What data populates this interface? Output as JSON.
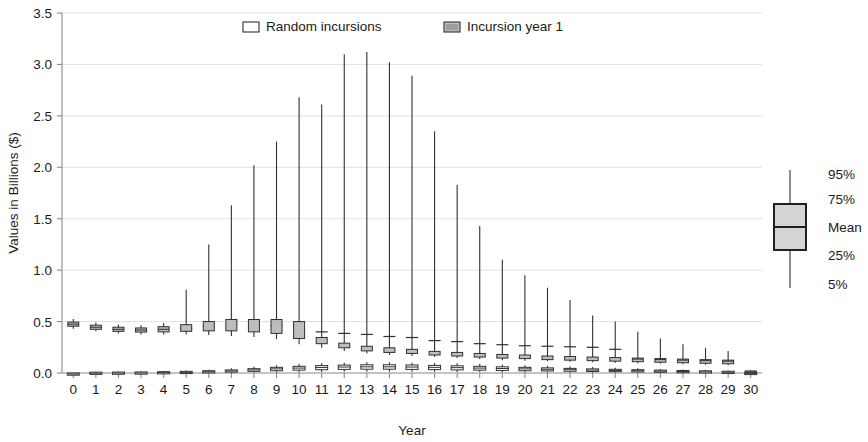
{
  "chart_data": {
    "type": "box",
    "title": "",
    "xlabel": "Year",
    "ylabel": "Values in Billions ($)",
    "xlim": [
      -0.5,
      30.5
    ],
    "ylim": [
      0.0,
      3.5
    ],
    "ytick_labels": [
      "0.0",
      "0.5",
      "1.0",
      "1.5",
      "2.0",
      "2.5",
      "3.0",
      "3.5"
    ],
    "ytick_values": [
      0.0,
      0.5,
      1.0,
      1.5,
      2.0,
      2.5,
      3.0,
      3.5
    ],
    "xtick_labels": [
      "0",
      "1",
      "2",
      "3",
      "4",
      "5",
      "6",
      "7",
      "8",
      "9",
      "10",
      "11",
      "12",
      "13",
      "14",
      "15",
      "16",
      "17",
      "18",
      "19",
      "20",
      "21",
      "22",
      "23",
      "24",
      "25",
      "26",
      "27",
      "28",
      "29",
      "30"
    ],
    "grid": true,
    "grid_axis": "y",
    "legend": {
      "position": "top-center",
      "entries": [
        {
          "label": "Random incursions",
          "fill": "#ffffff",
          "stroke": "#303030"
        },
        {
          "label": "Incursion year 1",
          "fill": "#bdbdbd",
          "stroke": "#303030"
        }
      ]
    },
    "key": {
      "position": "right",
      "labels": [
        "95%",
        "75%",
        "Mean",
        "25%",
        "5%"
      ],
      "fill": "#d4d4d4",
      "stroke": "#202020"
    },
    "series": [
      {
        "name": "Incursion year 1",
        "fill": "#bdbdbd",
        "stroke": "#303030",
        "boxes": [
          {
            "x": 0,
            "p5": 0.43,
            "p25": 0.455,
            "mean": 0.475,
            "p75": 0.495,
            "p95": 0.525
          },
          {
            "x": 1,
            "p5": 0.405,
            "p25": 0.425,
            "mean": 0.445,
            "p75": 0.465,
            "p95": 0.49
          },
          {
            "x": 2,
            "p5": 0.385,
            "p25": 0.405,
            "mean": 0.425,
            "p75": 0.445,
            "p95": 0.47
          },
          {
            "x": 3,
            "p5": 0.375,
            "p25": 0.398,
            "mean": 0.418,
            "p75": 0.438,
            "p95": 0.465
          },
          {
            "x": 4,
            "p5": 0.375,
            "p25": 0.4,
            "mean": 0.425,
            "p75": 0.45,
            "p95": 0.485
          },
          {
            "x": 5,
            "p5": 0.375,
            "p25": 0.405,
            "mean": 0.435,
            "p75": 0.47,
            "p95": 0.81
          },
          {
            "x": 6,
            "p5": 0.37,
            "p25": 0.41,
            "mean": 0.455,
            "p75": 0.5,
            "p95": 1.25
          },
          {
            "x": 7,
            "p5": 0.36,
            "p25": 0.41,
            "mean": 0.47,
            "p75": 0.52,
            "p95": 1.63
          },
          {
            "x": 8,
            "p5": 0.35,
            "p25": 0.4,
            "mean": 0.465,
            "p75": 0.52,
            "p95": 2.02
          },
          {
            "x": 9,
            "p5": 0.33,
            "p25": 0.385,
            "mean": 0.46,
            "p75": 0.52,
            "p95": 2.25
          },
          {
            "x": 10,
            "p5": 0.28,
            "p25": 0.335,
            "mean": 0.43,
            "p75": 0.5,
            "p95": 2.68
          },
          {
            "x": 11,
            "p5": 0.245,
            "p25": 0.285,
            "mean": 0.4,
            "p75": 0.345,
            "p95": 2.61
          },
          {
            "x": 12,
            "p5": 0.215,
            "p25": 0.245,
            "mean": 0.385,
            "p75": 0.29,
            "p95": 3.1
          },
          {
            "x": 13,
            "p5": 0.19,
            "p25": 0.215,
            "mean": 0.375,
            "p75": 0.26,
            "p95": 3.12
          },
          {
            "x": 14,
            "p5": 0.175,
            "p25": 0.2,
            "mean": 0.355,
            "p75": 0.245,
            "p95": 3.02
          },
          {
            "x": 15,
            "p5": 0.165,
            "p25": 0.19,
            "mean": 0.345,
            "p75": 0.23,
            "p95": 2.89
          },
          {
            "x": 16,
            "p5": 0.155,
            "p25": 0.175,
            "mean": 0.315,
            "p75": 0.21,
            "p95": 2.35
          },
          {
            "x": 17,
            "p5": 0.145,
            "p25": 0.165,
            "mean": 0.305,
            "p75": 0.2,
            "p95": 1.83
          },
          {
            "x": 18,
            "p5": 0.135,
            "p25": 0.155,
            "mean": 0.285,
            "p75": 0.19,
            "p95": 1.43
          },
          {
            "x": 19,
            "p5": 0.125,
            "p25": 0.145,
            "mean": 0.275,
            "p75": 0.18,
            "p95": 1.1
          },
          {
            "x": 20,
            "p5": 0.12,
            "p25": 0.14,
            "mean": 0.265,
            "p75": 0.175,
            "p95": 0.95
          },
          {
            "x": 21,
            "p5": 0.115,
            "p25": 0.13,
            "mean": 0.26,
            "p75": 0.165,
            "p95": 0.83
          },
          {
            "x": 22,
            "p5": 0.11,
            "p25": 0.125,
            "mean": 0.255,
            "p75": 0.16,
            "p95": 0.71
          },
          {
            "x": 23,
            "p5": 0.105,
            "p25": 0.12,
            "mean": 0.25,
            "p75": 0.155,
            "p95": 0.56
          },
          {
            "x": 24,
            "p5": 0.1,
            "p25": 0.115,
            "mean": 0.23,
            "p75": 0.15,
            "p95": 0.5
          },
          {
            "x": 25,
            "p5": 0.095,
            "p25": 0.11,
            "mean": 0.215,
            "p75": 0.145,
            "p95": 0.4
          },
          {
            "x": 26,
            "p5": 0.09,
            "p25": 0.105,
            "mean": 0.205,
            "p75": 0.14,
            "p95": 0.335
          },
          {
            "x": 27,
            "p5": 0.085,
            "p25": 0.1,
            "mean": 0.195,
            "p75": 0.135,
            "p95": 0.28
          },
          {
            "x": 28,
            "p5": 0.08,
            "p25": 0.095,
            "mean": 0.19,
            "p75": 0.13,
            "p95": 0.245
          },
          {
            "x": 29,
            "p5": 0.075,
            "p25": 0.09,
            "mean": 0.185,
            "p75": 0.125,
            "p95": 0.215
          },
          {
            "x": 30,
            "p5": 0.005,
            "p25": 0.01,
            "mean": 0.015,
            "p75": 0.02,
            "p95": 0.025
          }
        ]
      },
      {
        "name": "Random incursions",
        "fill": "#ffffff",
        "stroke": "#303030",
        "boxes": [
          {
            "x": 0,
            "p5": 0.0,
            "p25": 0.0,
            "mean": 0.0,
            "p75": 0.0,
            "p95": 0.0
          },
          {
            "x": 1,
            "p5": 0.0,
            "p25": 0.0,
            "mean": 0.005,
            "p75": 0.008,
            "p95": 0.012
          },
          {
            "x": 2,
            "p5": 0.0,
            "p25": 0.0,
            "mean": 0.005,
            "p75": 0.009,
            "p95": 0.013
          },
          {
            "x": 3,
            "p5": 0.0,
            "p25": 0.002,
            "mean": 0.006,
            "p75": 0.01,
            "p95": 0.015
          },
          {
            "x": 4,
            "p5": 0.0,
            "p25": 0.003,
            "mean": 0.008,
            "p75": 0.013,
            "p95": 0.018
          },
          {
            "x": 5,
            "p5": 0.0,
            "p25": 0.004,
            "mean": 0.01,
            "p75": 0.016,
            "p95": 0.024
          },
          {
            "x": 6,
            "p5": 0.0,
            "p25": 0.006,
            "mean": 0.014,
            "p75": 0.022,
            "p95": 0.032
          },
          {
            "x": 7,
            "p5": 0.002,
            "p25": 0.01,
            "mean": 0.02,
            "p75": 0.03,
            "p95": 0.045
          },
          {
            "x": 8,
            "p5": 0.004,
            "p25": 0.016,
            "mean": 0.03,
            "p75": 0.042,
            "p95": 0.06
          },
          {
            "x": 9,
            "p5": 0.006,
            "p25": 0.022,
            "mean": 0.04,
            "p75": 0.055,
            "p95": 0.075
          },
          {
            "x": 10,
            "p5": 0.008,
            "p25": 0.028,
            "mean": 0.048,
            "p75": 0.065,
            "p95": 0.088
          },
          {
            "x": 11,
            "p5": 0.01,
            "p25": 0.032,
            "mean": 0.054,
            "p75": 0.072,
            "p95": 0.096
          },
          {
            "x": 12,
            "p5": 0.012,
            "p25": 0.035,
            "mean": 0.058,
            "p75": 0.077,
            "p95": 0.1
          },
          {
            "x": 13,
            "p5": 0.013,
            "p25": 0.037,
            "mean": 0.06,
            "p75": 0.08,
            "p95": 0.105
          },
          {
            "x": 14,
            "p5": 0.013,
            "p25": 0.037,
            "mean": 0.06,
            "p75": 0.08,
            "p95": 0.105
          },
          {
            "x": 15,
            "p5": 0.012,
            "p25": 0.035,
            "mean": 0.058,
            "p75": 0.078,
            "p95": 0.1
          },
          {
            "x": 16,
            "p5": 0.011,
            "p25": 0.033,
            "mean": 0.055,
            "p75": 0.074,
            "p95": 0.098
          },
          {
            "x": 17,
            "p5": 0.01,
            "p25": 0.03,
            "mean": 0.052,
            "p75": 0.07,
            "p95": 0.094
          },
          {
            "x": 18,
            "p5": 0.009,
            "p25": 0.028,
            "mean": 0.048,
            "p75": 0.065,
            "p95": 0.088
          },
          {
            "x": 19,
            "p5": 0.008,
            "p25": 0.025,
            "mean": 0.044,
            "p75": 0.06,
            "p95": 0.082
          },
          {
            "x": 20,
            "p5": 0.007,
            "p25": 0.022,
            "mean": 0.04,
            "p75": 0.055,
            "p95": 0.076
          },
          {
            "x": 21,
            "p5": 0.006,
            "p25": 0.02,
            "mean": 0.036,
            "p75": 0.05,
            "p95": 0.07
          },
          {
            "x": 22,
            "p5": 0.005,
            "p25": 0.017,
            "mean": 0.032,
            "p75": 0.045,
            "p95": 0.064
          },
          {
            "x": 23,
            "p5": 0.004,
            "p25": 0.015,
            "mean": 0.028,
            "p75": 0.04,
            "p95": 0.058
          },
          {
            "x": 24,
            "p5": 0.004,
            "p25": 0.013,
            "mean": 0.025,
            "p75": 0.036,
            "p95": 0.052
          },
          {
            "x": 25,
            "p5": 0.003,
            "p25": 0.011,
            "mean": 0.022,
            "p75": 0.032,
            "p95": 0.046
          },
          {
            "x": 26,
            "p5": 0.003,
            "p25": 0.01,
            "mean": 0.019,
            "p75": 0.028,
            "p95": 0.04
          },
          {
            "x": 27,
            "p5": 0.002,
            "p25": 0.008,
            "mean": 0.016,
            "p75": 0.024,
            "p95": 0.035
          },
          {
            "x": 28,
            "p5": 0.002,
            "p25": 0.007,
            "mean": 0.014,
            "p75": 0.021,
            "p95": 0.03
          },
          {
            "x": 29,
            "p5": 0.001,
            "p25": 0.005,
            "mean": 0.011,
            "p75": 0.017,
            "p95": 0.025
          },
          {
            "x": 30,
            "p5": 0.0,
            "p25": 0.001,
            "mean": 0.003,
            "p75": 0.006,
            "p95": 0.01
          }
        ]
      }
    ]
  }
}
